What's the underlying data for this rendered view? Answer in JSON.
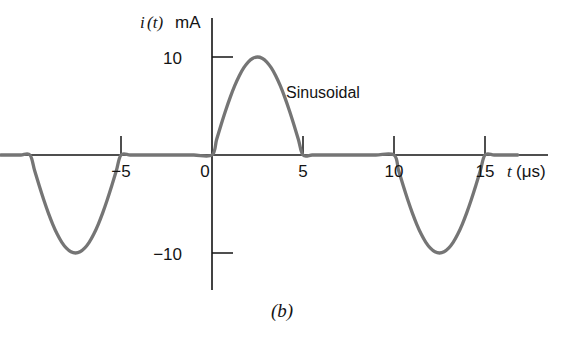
{
  "figure": {
    "caption": "(b)",
    "annotation": "Sinusoidal",
    "y_axis_title": "i(t) mA",
    "y_axis_symbol": "i",
    "y_axis_paren_t": "(t)",
    "y_axis_unit": "mA",
    "x_axis_symbol": "t",
    "x_axis_unit": "(μs)"
  },
  "axis": {
    "y_ticks": [
      {
        "label": "10",
        "value": 10
      },
      {
        "label": "−10",
        "value": -10
      }
    ],
    "x_ticks": [
      {
        "label": "−5",
        "value": -5
      },
      {
        "label": "0",
        "value": 0
      },
      {
        "label": "5",
        "value": 5
      },
      {
        "label": "10",
        "value": 10
      },
      {
        "label": "15",
        "value": 15
      }
    ]
  },
  "colors": {
    "curve": "#757575",
    "axis": "#141414",
    "text": "#141414",
    "background": "#ffffff"
  },
  "chart_data": {
    "type": "line",
    "title": "",
    "subtitle": "",
    "xlabel": "t (μs)",
    "ylabel": "i(t) mA",
    "xlim": [
      -11.6,
      16.8
    ],
    "ylim": [
      -13.5,
      12.5
    ],
    "xticks": [
      -5,
      0,
      5,
      10,
      15
    ],
    "xticklabels": [
      "−5",
      "0",
      "5",
      "10",
      "15"
    ],
    "yticks": [
      10,
      -10
    ],
    "yticklabels": [
      "10",
      "−10"
    ],
    "grid": false,
    "legend": null,
    "annotations": [
      {
        "text": "Sinusoidal",
        "x": 5.6,
        "y": 7.0
      },
      {
        "text": "(b)",
        "x": 3.0,
        "y": -17.0
      }
    ],
    "amplitude_mA": 10,
    "pulse_width_us": 5,
    "period_us": 20,
    "segments": [
      {
        "type": "sine-negative-half",
        "t_start": -10,
        "t_end": -5,
        "peak_t": -7.5,
        "peak_value": -10
      },
      {
        "type": "zero",
        "t_start": -5,
        "t_end": 0,
        "peak_value": 0
      },
      {
        "type": "sine-positive-half",
        "t_start": 0,
        "t_end": 5,
        "peak_t": 2.5,
        "peak_value": 10
      },
      {
        "type": "zero",
        "t_start": 5,
        "t_end": 10,
        "peak_value": 0
      },
      {
        "type": "sine-negative-half",
        "t_start": 10,
        "t_end": 15,
        "peak_t": 12.5,
        "peak_value": -10
      },
      {
        "type": "zero",
        "t_start": 15,
        "t_end": 16.8,
        "peak_value": 0
      }
    ],
    "series": [
      {
        "name": "i(t)",
        "x": [
          -11.6,
          -11.0,
          -10.5,
          -10.0,
          -9.75,
          -9.5,
          -9.25,
          -9.0,
          -8.75,
          -8.5,
          -8.25,
          -8.0,
          -7.75,
          -7.5,
          -7.25,
          -7.0,
          -6.75,
          -6.5,
          -6.25,
          -6.0,
          -5.75,
          -5.5,
          -5.25,
          -5.0,
          -4.5,
          -4.0,
          -3.0,
          -2.0,
          -1.0,
          0.0,
          0.25,
          0.5,
          0.75,
          1.0,
          1.25,
          1.5,
          1.75,
          2.0,
          2.25,
          2.5,
          2.75,
          3.0,
          3.25,
          3.5,
          3.75,
          4.0,
          4.25,
          4.5,
          4.75,
          5.0,
          5.5,
          6.0,
          7.0,
          8.0,
          9.0,
          10.0,
          10.25,
          10.5,
          10.75,
          11.0,
          11.25,
          11.5,
          11.75,
          12.0,
          12.25,
          12.5,
          12.75,
          13.0,
          13.25,
          13.5,
          13.75,
          14.0,
          14.25,
          14.5,
          14.75,
          15.0,
          15.5,
          16.0,
          16.8
        ],
        "y": [
          0,
          0,
          0,
          0,
          -1.56,
          -3.09,
          -4.54,
          -5.88,
          -7.07,
          -8.09,
          -8.91,
          -9.51,
          -9.88,
          -10.0,
          -9.88,
          -9.51,
          -8.91,
          -8.09,
          -7.07,
          -5.88,
          -4.54,
          -3.09,
          -1.56,
          0,
          0,
          0,
          0,
          0,
          0,
          0,
          1.56,
          3.09,
          4.54,
          5.88,
          7.07,
          8.09,
          8.91,
          9.51,
          9.88,
          10.0,
          9.88,
          9.51,
          8.91,
          8.09,
          7.07,
          5.88,
          4.54,
          3.09,
          1.56,
          0,
          0,
          0,
          0,
          0,
          0,
          0,
          -1.56,
          -3.09,
          -4.54,
          -5.88,
          -7.07,
          -8.09,
          -8.91,
          -9.51,
          -9.88,
          -10.0,
          -9.88,
          -9.51,
          -8.91,
          -8.09,
          -7.07,
          -5.88,
          -4.54,
          -3.09,
          -1.56,
          0,
          0,
          0,
          0
        ]
      }
    ]
  }
}
